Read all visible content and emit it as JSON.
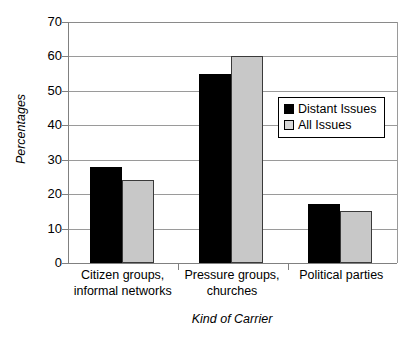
{
  "chart_data": {
    "type": "bar",
    "title": "",
    "xlabel": "Kind of Carrier",
    "ylabel": "Percentages",
    "categories": [
      "Citizen groups, informal networks",
      "Pressure groups, churches",
      "Political parties"
    ],
    "category_lines": [
      [
        "Citizen groups,",
        "informal networks"
      ],
      [
        "Pressure groups,",
        "churches"
      ],
      [
        "Political parties",
        ""
      ]
    ],
    "series": [
      {
        "name": "Distant Issues",
        "color": "#000000",
        "values": [
          28,
          55,
          17
        ]
      },
      {
        "name": "All Issues",
        "color": "#c8c8c8",
        "values": [
          24,
          60,
          15
        ]
      }
    ],
    "ylim": [
      0,
      70
    ],
    "ytick_step": 10,
    "yticks": [
      70,
      60,
      50,
      40,
      30,
      20,
      10,
      0
    ],
    "ytick_labels": [
      "70",
      "60",
      "50",
      "40",
      "30",
      "20",
      "10",
      "0"
    ],
    "grid": true,
    "legend_position": "center-right",
    "legend_entries": [
      "Distant Issues",
      "All Issues"
    ]
  }
}
